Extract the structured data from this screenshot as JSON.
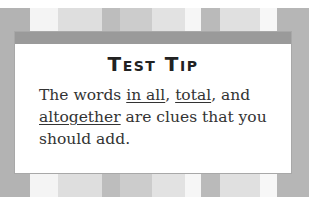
{
  "tip": {
    "title": "Test Tip",
    "body_parts": {
      "p1": "The words ",
      "k1": "in all",
      "p2": ", ",
      "k2": "total",
      "p3": ", and ",
      "k3": "altogether",
      "p4": " are clues that you should add."
    }
  },
  "colors": {
    "frame": "#b5b5b5",
    "bar": "#9a9a9a",
    "card": "#ffffff"
  }
}
